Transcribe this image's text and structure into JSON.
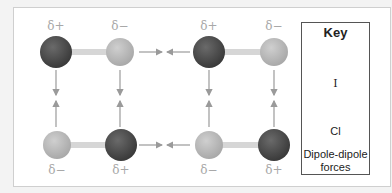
{
  "diagram": {
    "labels": {
      "top_left_i": "δ+",
      "top_left_cl": "δ−",
      "top_right_i": "δ+",
      "top_right_cl": "δ−",
      "bottom_left_cl": "δ−",
      "bottom_left_i": "δ+",
      "bottom_right_cl": "δ−",
      "bottom_right_i": "δ+"
    },
    "colors": {
      "iodine": "#4a4a4a",
      "chlorine": "#b9b9b9",
      "bond": "#d6d6d6",
      "arrow": "#9a9a9a",
      "delta_text": "#a8a8a8"
    }
  },
  "key": {
    "title": "Key",
    "iodine_label": "I",
    "chlorine_label": "Cl",
    "force_label_line1": "Dipole-dipole",
    "force_label_line2": "forces"
  }
}
